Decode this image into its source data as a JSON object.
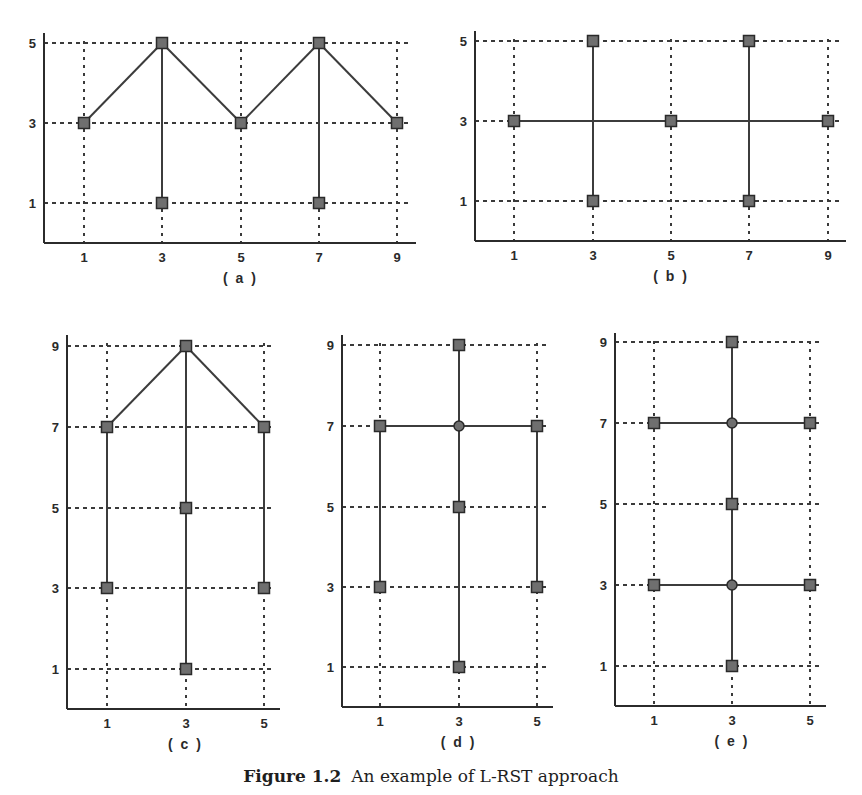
{
  "caption": {
    "number": "Figure 1.2",
    "text": "An example of L-RST approach"
  },
  "colors": {
    "axis": "#2b2b2b",
    "grid": "#3a3a3a",
    "edge": "#3c3c3c",
    "marker_fill": "#6f6f6f",
    "marker_stroke": "#2a2a2a"
  },
  "chart_data": [
    {
      "type": "scatter",
      "panel": "a",
      "label": "( a )",
      "xticks": [
        1,
        3,
        5,
        7,
        9
      ],
      "yticks": [
        1,
        3,
        5
      ],
      "xlim": [
        0,
        9.3
      ],
      "ylim": [
        0,
        5.5
      ],
      "grid": true,
      "nodes": [
        {
          "x": 1,
          "y": 3,
          "marker": "square"
        },
        {
          "x": 3,
          "y": 5,
          "marker": "square"
        },
        {
          "x": 3,
          "y": 1,
          "marker": "square"
        },
        {
          "x": 5,
          "y": 3,
          "marker": "square"
        },
        {
          "x": 7,
          "y": 5,
          "marker": "square"
        },
        {
          "x": 7,
          "y": 1,
          "marker": "square"
        },
        {
          "x": 9,
          "y": 3,
          "marker": "square"
        }
      ],
      "edges": [
        [
          [
            1,
            3
          ],
          [
            3,
            5
          ]
        ],
        [
          [
            3,
            5
          ],
          [
            5,
            3
          ]
        ],
        [
          [
            5,
            3
          ],
          [
            7,
            5
          ]
        ],
        [
          [
            7,
            5
          ],
          [
            9,
            3
          ]
        ],
        [
          [
            3,
            5
          ],
          [
            3,
            1
          ]
        ],
        [
          [
            7,
            5
          ],
          [
            7,
            1
          ]
        ]
      ],
      "px": {
        "axis_x": 44,
        "base_y": 243,
        "top_y": 33,
        "right_x": 410,
        "x_map": {
          "1": 84,
          "3": 162,
          "5": 241,
          "7": 319,
          "9": 397
        },
        "y_map": {
          "1": 203,
          "3": 123,
          "5": 43
        }
      }
    },
    {
      "type": "scatter",
      "panel": "b",
      "label": "( b )",
      "xticks": [
        1,
        3,
        5,
        7,
        9
      ],
      "yticks": [
        1,
        3,
        5
      ],
      "xlim": [
        0,
        9.3
      ],
      "ylim": [
        0,
        5.5
      ],
      "grid": true,
      "nodes": [
        {
          "x": 1,
          "y": 3,
          "marker": "square"
        },
        {
          "x": 3,
          "y": 5,
          "marker": "square"
        },
        {
          "x": 3,
          "y": 1,
          "marker": "square"
        },
        {
          "x": 5,
          "y": 3,
          "marker": "square"
        },
        {
          "x": 7,
          "y": 5,
          "marker": "square"
        },
        {
          "x": 7,
          "y": 1,
          "marker": "square"
        },
        {
          "x": 9,
          "y": 3,
          "marker": "square"
        }
      ],
      "edges": [
        [
          [
            1,
            3
          ],
          [
            9,
            3
          ]
        ],
        [
          [
            3,
            5
          ],
          [
            3,
            1
          ]
        ],
        [
          [
            7,
            5
          ],
          [
            7,
            1
          ]
        ]
      ],
      "px": {
        "axis_x": 475,
        "base_y": 241,
        "top_y": 31,
        "right_x": 840,
        "x_map": {
          "1": 514,
          "3": 593,
          "5": 671,
          "7": 749,
          "9": 828
        },
        "y_map": {
          "1": 201,
          "3": 121,
          "5": 41
        }
      }
    },
    {
      "type": "scatter",
      "panel": "c",
      "label": "( c )",
      "xticks": [
        1,
        3,
        5
      ],
      "yticks": [
        1,
        3,
        5,
        7,
        9
      ],
      "xlim": [
        0,
        5.5
      ],
      "ylim": [
        0,
        9.5
      ],
      "grid": true,
      "nodes": [
        {
          "x": 3,
          "y": 9,
          "marker": "square"
        },
        {
          "x": 1,
          "y": 7,
          "marker": "square"
        },
        {
          "x": 5,
          "y": 7,
          "marker": "square"
        },
        {
          "x": 3,
          "y": 5,
          "marker": "square"
        },
        {
          "x": 1,
          "y": 3,
          "marker": "square"
        },
        {
          "x": 5,
          "y": 3,
          "marker": "square"
        },
        {
          "x": 3,
          "y": 1,
          "marker": "square"
        }
      ],
      "edges": [
        [
          [
            1,
            7
          ],
          [
            3,
            9
          ]
        ],
        [
          [
            3,
            9
          ],
          [
            5,
            7
          ]
        ],
        [
          [
            1,
            7
          ],
          [
            1,
            3
          ]
        ],
        [
          [
            5,
            7
          ],
          [
            5,
            3
          ]
        ],
        [
          [
            3,
            9
          ],
          [
            3,
            1
          ]
        ]
      ],
      "px": {
        "axis_x": 67,
        "base_y": 709,
        "top_y": 335,
        "right_x": 274,
        "x_map": {
          "1": 107,
          "3": 186,
          "5": 264
        },
        "y_map": {
          "1": 669,
          "3": 588,
          "5": 508,
          "7": 427,
          "9": 346
        }
      }
    },
    {
      "type": "scatter",
      "panel": "d",
      "label": "( d )",
      "xticks": [
        1,
        3,
        5
      ],
      "yticks": [
        1,
        3,
        5,
        7,
        9
      ],
      "xlim": [
        0,
        5.5
      ],
      "ylim": [
        0,
        9.5
      ],
      "grid": true,
      "nodes": [
        {
          "x": 3,
          "y": 9,
          "marker": "square"
        },
        {
          "x": 1,
          "y": 7,
          "marker": "square"
        },
        {
          "x": 3,
          "y": 7,
          "marker": "circle"
        },
        {
          "x": 5,
          "y": 7,
          "marker": "square"
        },
        {
          "x": 3,
          "y": 5,
          "marker": "square"
        },
        {
          "x": 1,
          "y": 3,
          "marker": "square"
        },
        {
          "x": 5,
          "y": 3,
          "marker": "square"
        },
        {
          "x": 3,
          "y": 1,
          "marker": "square"
        }
      ],
      "edges": [
        [
          [
            1,
            7
          ],
          [
            5,
            7
          ]
        ],
        [
          [
            1,
            7
          ],
          [
            1,
            3
          ]
        ],
        [
          [
            5,
            7
          ],
          [
            5,
            3
          ]
        ],
        [
          [
            3,
            9
          ],
          [
            3,
            1
          ]
        ]
      ],
      "px": {
        "axis_x": 342,
        "base_y": 707,
        "top_y": 335,
        "right_x": 547,
        "x_map": {
          "1": 380,
          "3": 459,
          "5": 537
        },
        "y_map": {
          "1": 667,
          "3": 587,
          "5": 507,
          "7": 426,
          "9": 345
        }
      }
    },
    {
      "type": "scatter",
      "panel": "e",
      "label": "( e )",
      "xticks": [
        1,
        3,
        5
      ],
      "yticks": [
        1,
        3,
        5,
        7,
        9
      ],
      "xlim": [
        0,
        5.5
      ],
      "ylim": [
        0,
        9.5
      ],
      "grid": true,
      "nodes": [
        {
          "x": 3,
          "y": 9,
          "marker": "square"
        },
        {
          "x": 1,
          "y": 7,
          "marker": "square"
        },
        {
          "x": 3,
          "y": 7,
          "marker": "circle"
        },
        {
          "x": 5,
          "y": 7,
          "marker": "square"
        },
        {
          "x": 3,
          "y": 5,
          "marker": "square"
        },
        {
          "x": 1,
          "y": 3,
          "marker": "square"
        },
        {
          "x": 3,
          "y": 3,
          "marker": "circle"
        },
        {
          "x": 5,
          "y": 3,
          "marker": "square"
        },
        {
          "x": 3,
          "y": 1,
          "marker": "square"
        }
      ],
      "edges": [
        [
          [
            1,
            7
          ],
          [
            5,
            7
          ]
        ],
        [
          [
            1,
            3
          ],
          [
            5,
            3
          ]
        ],
        [
          [
            3,
            9
          ],
          [
            3,
            1
          ]
        ]
      ],
      "px": {
        "axis_x": 615,
        "base_y": 706,
        "top_y": 333,
        "right_x": 820,
        "x_map": {
          "1": 654,
          "3": 732,
          "5": 810
        },
        "y_map": {
          "1": 666,
          "3": 585,
          "5": 504,
          "7": 423,
          "9": 342
        }
      }
    }
  ]
}
